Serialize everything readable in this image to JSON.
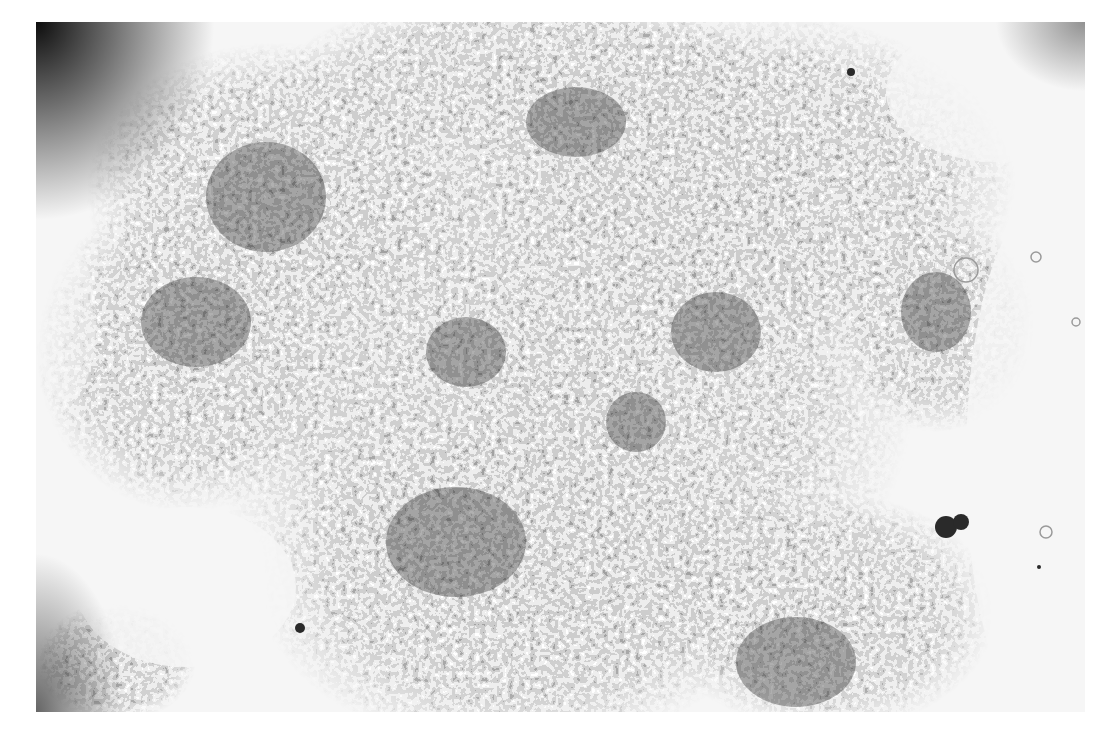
{
  "image": {
    "kind": "brightfield-micrograph",
    "subject": "dense cluster of small round cells (grayscale)",
    "frame": {
      "left": 36,
      "top": 22,
      "width": 1049,
      "height": 690
    },
    "colors": {
      "page_background": "#ffffff",
      "field_background": "#f4f4f4",
      "cell_dark": "#2a2a2a",
      "cell_mid": "#6a6a6a",
      "cell_light": "#b8b8b8"
    },
    "regions": [
      {
        "name": "dense-cluster-upper-left",
        "cx": 240,
        "cy": 170,
        "rx": 170,
        "ry": 130
      },
      {
        "name": "dense-cluster-left",
        "cx": 150,
        "cy": 330,
        "rx": 130,
        "ry": 140
      },
      {
        "name": "dense-cluster-center",
        "cx": 520,
        "cy": 360,
        "rx": 330,
        "ry": 280
      },
      {
        "name": "dense-cluster-upper-right",
        "cx": 720,
        "cy": 160,
        "rx": 230,
        "ry": 140
      },
      {
        "name": "dense-cluster-lower-center",
        "cx": 480,
        "cy": 560,
        "rx": 230,
        "ry": 140
      },
      {
        "name": "dense-cluster-lower-right",
        "cx": 790,
        "cy": 590,
        "rx": 140,
        "ry": 100
      },
      {
        "name": "dense-cluster-right",
        "cx": 900,
        "cy": 300,
        "rx": 70,
        "ry": 80
      },
      {
        "name": "sparse-area-lower-left",
        "cx": 140,
        "cy": 560,
        "rx": 120,
        "ry": 90
      },
      {
        "name": "sparse-area-right",
        "cx": 990,
        "cy": 430,
        "rx": 80,
        "ry": 260
      }
    ]
  }
}
